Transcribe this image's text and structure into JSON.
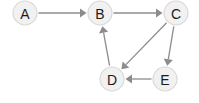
{
  "diagram": {
    "type": "directed-graph",
    "background_color": "#ffffff",
    "node_fill_color": "#f1f1f1",
    "node_stroke_color": "#d8d8d8",
    "node_label_color": "#1b1b1b",
    "edge_color": "#8c8c8c",
    "node_radius": 12,
    "nodes": [
      {
        "id": "A",
        "label": "A",
        "cx": 25,
        "cy": 13
      },
      {
        "id": "B",
        "label": "B",
        "cx": 100,
        "cy": 13
      },
      {
        "id": "C",
        "label": "C",
        "cx": 176,
        "cy": 13
      },
      {
        "id": "D",
        "label": "D",
        "cx": 112,
        "cy": 79
      },
      {
        "id": "E",
        "label": "E",
        "cx": 165,
        "cy": 79
      }
    ],
    "edges": [
      {
        "from": "A",
        "to": "B",
        "directed": true
      },
      {
        "from": "B",
        "to": "C",
        "directed": true
      },
      {
        "from": "C",
        "to": "D",
        "directed": true
      },
      {
        "from": "C",
        "to": "E",
        "directed": true
      },
      {
        "from": "D",
        "to": "B",
        "directed": true
      },
      {
        "from": "E",
        "to": "D",
        "directed": true
      }
    ]
  }
}
